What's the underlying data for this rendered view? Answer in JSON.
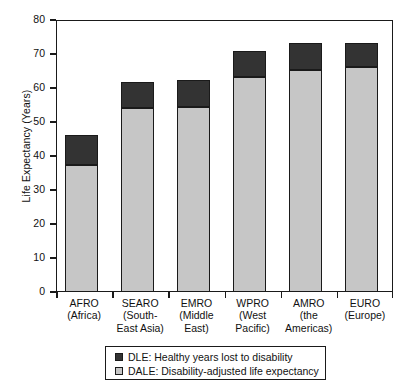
{
  "chart_data": {
    "type": "bar",
    "subtype": "stacked-vertical",
    "title": "",
    "xlabel": "",
    "ylabel": "Life Expectancy (Years)",
    "ylim": [
      0,
      80
    ],
    "yticks": [
      0,
      10,
      20,
      30,
      40,
      50,
      60,
      70,
      80
    ],
    "ytick_labels": [
      "0",
      "10",
      "20",
      "30",
      "40",
      "50",
      "60",
      "70",
      "80"
    ],
    "grid": false,
    "legend_position": "below-axes",
    "categories": [
      "AFRO\n(Africa)",
      "SEARO\n(South-\nEast Asia)",
      "EMRO\n(Middle\nEast)",
      "WPRO\n(West\nPacific)",
      "AMRO\n(the\nAmericas)",
      "EURO\n(Europe)"
    ],
    "category_lines": [
      [
        "AFRO",
        "(Africa)"
      ],
      [
        "SEARO",
        "(South-",
        "East Asia)"
      ],
      [
        "EMRO",
        "(Middle",
        "East)"
      ],
      [
        "WPRO",
        "(West",
        "Pacific)"
      ],
      [
        "AMRO",
        "(the",
        "Americas)"
      ],
      [
        "EURO",
        "(Europe)"
      ]
    ],
    "series": [
      {
        "name": "DALE: Disability-adjusted life expectancy",
        "short": "DALE",
        "color": "#c6c6c6",
        "values": [
          37.4,
          54.1,
          54.5,
          63.2,
          65.2,
          66.2
        ]
      },
      {
        "name": "DLE: Healthy years lost to disability",
        "short": "DLE",
        "color": "#333333",
        "values": [
          8.8,
          7.6,
          7.8,
          7.7,
          8.1,
          7.1
        ]
      }
    ],
    "totals": [
      46.2,
      61.7,
      62.3,
      70.9,
      73.3,
      73.3
    ]
  },
  "legend": {
    "items": [
      {
        "label": "DLE: Healthy years lost to disability",
        "color": "#333333"
      },
      {
        "label": "DALE: Disability-adjusted life expectancy",
        "color": "#c6c6c6"
      }
    ]
  },
  "colors": {
    "dle": "#333333",
    "dale": "#c6c6c6",
    "frame": "#1a1a1a",
    "background": "#ffffff"
  }
}
